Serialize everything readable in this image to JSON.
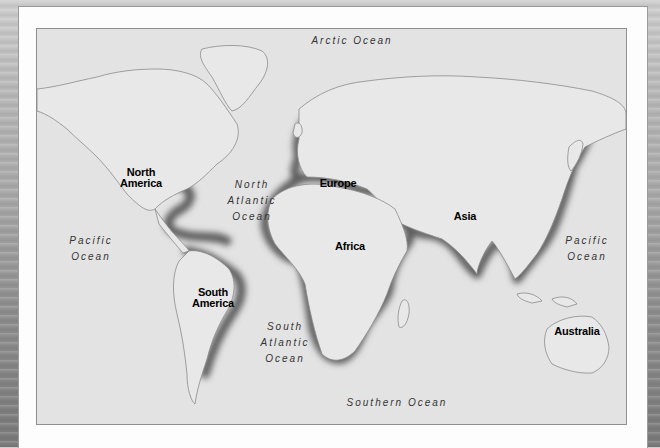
{
  "map": {
    "type": "world-map",
    "continents": [
      {
        "id": "north-america",
        "label_lines": [
          "North",
          "America"
        ]
      },
      {
        "id": "south-america",
        "label_lines": [
          "South",
          "America"
        ]
      },
      {
        "id": "europe",
        "label_lines": [
          "Europe"
        ]
      },
      {
        "id": "africa",
        "label_lines": [
          "Africa"
        ]
      },
      {
        "id": "asia",
        "label_lines": [
          "Asia"
        ]
      },
      {
        "id": "australia",
        "label_lines": [
          "Australia"
        ]
      }
    ],
    "oceans": [
      {
        "id": "arctic",
        "label_lines": [
          "Arctic Ocean"
        ]
      },
      {
        "id": "north-atlantic",
        "label_lines": [
          "North",
          "Atlantic",
          "Ocean"
        ]
      },
      {
        "id": "pacific-west",
        "label_lines": [
          "Pacific",
          "Ocean"
        ]
      },
      {
        "id": "pacific-east",
        "label_lines": [
          "Pacific",
          "Ocean"
        ]
      },
      {
        "id": "south-atlantic",
        "label_lines": [
          "South",
          "Atlantic",
          "Ocean"
        ]
      },
      {
        "id": "southern",
        "label_lines": [
          "Southern Ocean"
        ]
      }
    ],
    "highlighted_coastlines": [
      "Gulf of Mexico / Caribbean",
      "Eastern South America",
      "Western Europe / Mediterranean",
      "Africa coasts",
      "South & East Asia coasts",
      "Japan"
    ],
    "colors": {
      "land": "#e6e6e6",
      "sea": "#e3e3e3",
      "highlight": "#5a5a5a",
      "outline": "#8a8a8a"
    }
  }
}
